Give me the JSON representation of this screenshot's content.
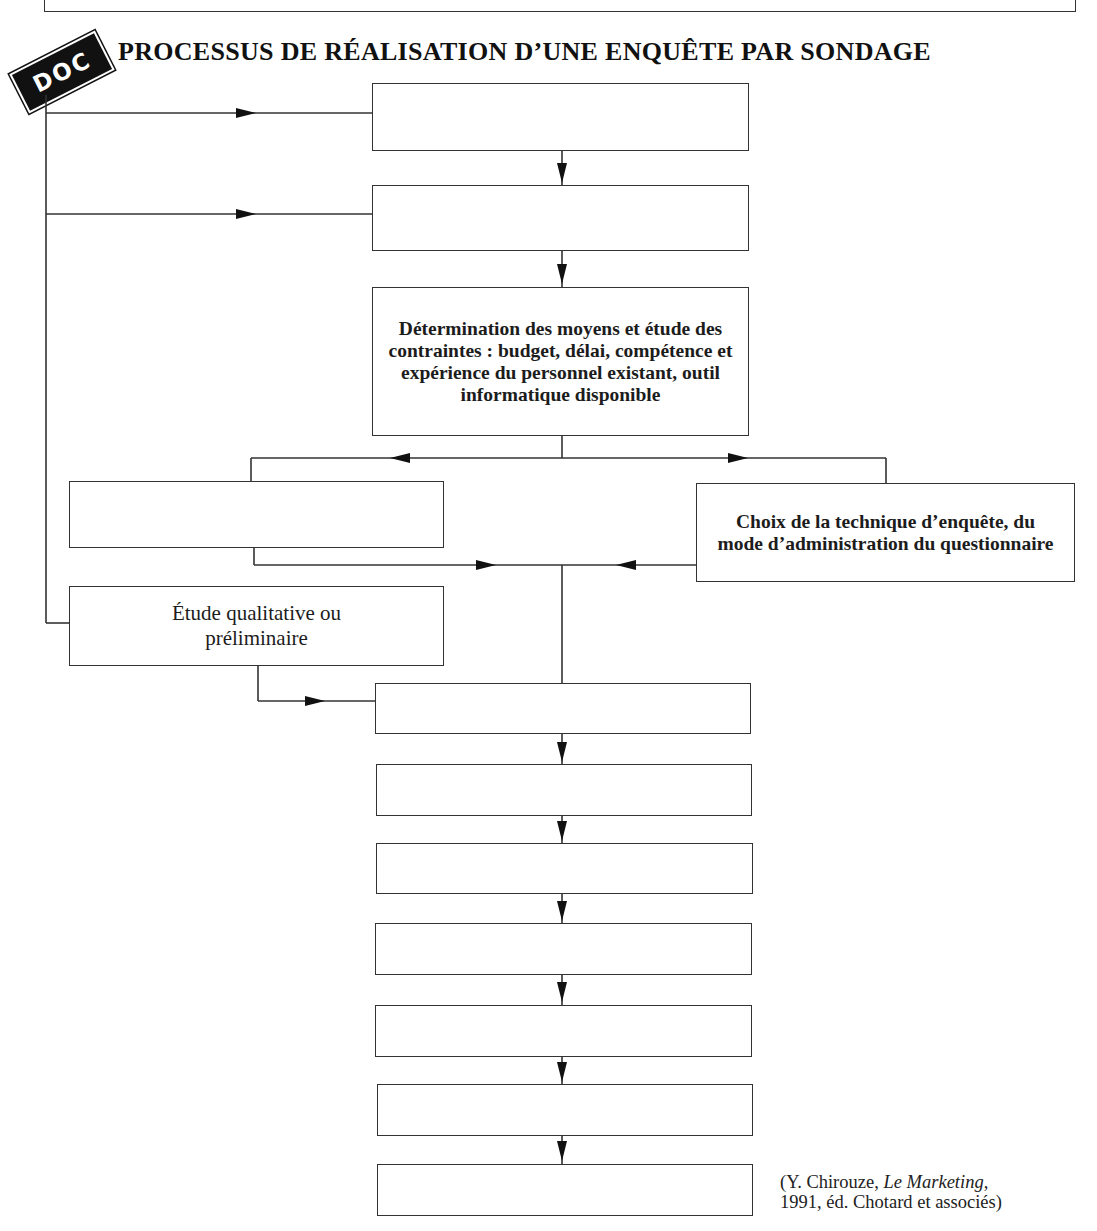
{
  "title": "PROCESSUS DE RÉALISATION D’UNE ENQUÊTE PAR SONDAGE",
  "badge": "DOC",
  "boxes": {
    "b1": "",
    "b2": "",
    "b3": "Détermination des moyens et étude des contraintes : budget, délai, compétence et expérience du personnel existant, outil informatique disponible",
    "b4_left": "",
    "b4_right": "Choix de la technique d’enquête, du mode d’administration du questionnaire",
    "b5_qualitative": "Étude qualitative ou préliminaire",
    "b6": "",
    "b7": "",
    "b8": "",
    "b9": "",
    "b10": "",
    "b11": "",
    "b12": ""
  },
  "source": {
    "line1_prefix": "(Y. Chirouze, ",
    "line1_italic": "Le Marketing",
    "line1_suffix": ",",
    "line2": "1991,  éd. Chotard et associés)"
  }
}
